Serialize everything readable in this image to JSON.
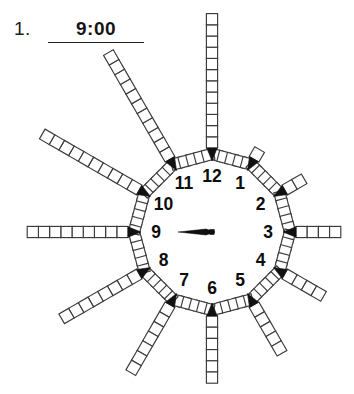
{
  "worksheet": {
    "item_number": "1.",
    "answer_value": "9:00",
    "answer_placeholder": "write the time"
  },
  "clock": {
    "time_shown": "9:00",
    "hour_hand_points_to": 9,
    "minute_hand_points_to": 12,
    "hour_labels": [
      "1",
      "2",
      "3",
      "4",
      "5",
      "6",
      "7",
      "8",
      "9",
      "10",
      "11",
      "12"
    ],
    "spoke_square_counts": {
      "1": 1,
      "2": 2,
      "3": 4,
      "4": 4,
      "5": 5,
      "6": 6,
      "7": 7,
      "8": 8,
      "9": 9,
      "10": 10,
      "11": 11,
      "12": 12
    },
    "ring_squares_per_segment": 5,
    "marker_shape": "arrowhead-pointing-inward",
    "square_fill": "#ffffff",
    "square_stroke": "#3a3a3a",
    "marker_color": "#111111",
    "hand_color": "#111111",
    "background": "#ffffff"
  }
}
